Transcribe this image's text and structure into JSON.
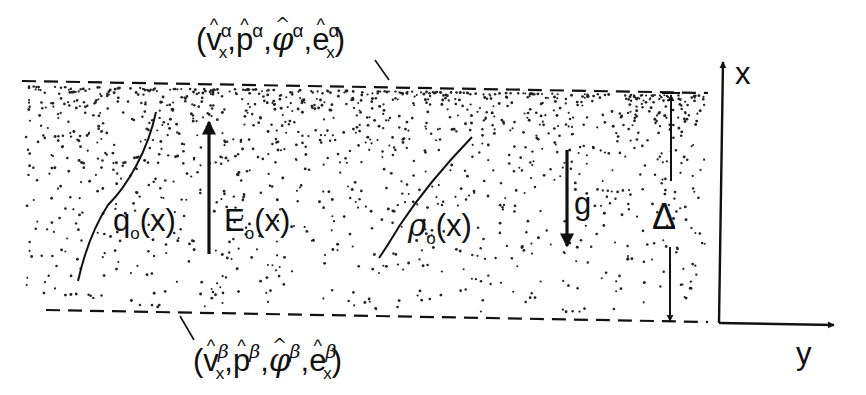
{
  "diagram": {
    "type": "physics-schematic",
    "colors": {
      "ink": "#111111",
      "background": "#ffffff"
    },
    "top_interface": {
      "label_open": "(",
      "label_close": ")",
      "terms": [
        {
          "base": "v",
          "hat": true,
          "sub": "x",
          "sup": "α"
        },
        {
          "base": "p",
          "hat": true,
          "sub": "",
          "sup": "α"
        },
        {
          "base": "φ",
          "hat": true,
          "sub": "",
          "sup": "α"
        },
        {
          "base": "e",
          "hat": true,
          "sub": "x",
          "sup": "α"
        }
      ],
      "separator": ","
    },
    "bottom_interface": {
      "label_open": "(",
      "label_close": ")",
      "terms": [
        {
          "base": "v",
          "hat": true,
          "sub": "x",
          "sup": "β"
        },
        {
          "base": "p",
          "hat": true,
          "sub": "",
          "sup": "β"
        },
        {
          "base": "φ",
          "hat": true,
          "sub": "",
          "sup": "β"
        },
        {
          "base": "e",
          "hat": true,
          "sub": "x",
          "sup": "β"
        }
      ],
      "separator": ","
    },
    "profiles": {
      "charge": {
        "symbol": "q",
        "sub": "o",
        "arg": "(x)"
      },
      "density": {
        "symbol": "ρ",
        "sub": "o",
        "arg": "(x)"
      }
    },
    "field": {
      "symbol": "E",
      "sub": "o",
      "arg": "(x)",
      "direction": "up"
    },
    "gravity": {
      "symbol": "g",
      "direction": "down"
    },
    "thickness": {
      "symbol": "Δ"
    },
    "axes": {
      "vertical": "x",
      "horizontal": "y"
    }
  }
}
